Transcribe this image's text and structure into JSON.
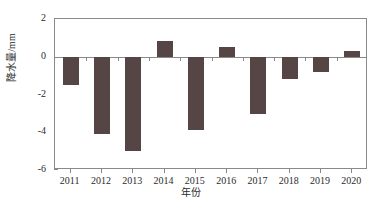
{
  "chart_data": {
    "type": "bar",
    "title": "",
    "xlabel": "年份",
    "ylabel": "降水量/mm",
    "categories": [
      "2011",
      "2012",
      "2013",
      "2014",
      "2015",
      "2016",
      "2017",
      "2018",
      "2019",
      "2020"
    ],
    "values": [
      -1.5,
      -4.1,
      -5.0,
      0.85,
      -3.9,
      0.5,
      -3.05,
      -1.2,
      -0.8,
      0.3
    ],
    "series": [
      {
        "name": "降水量距平",
        "values": [
          -1.5,
          -4.1,
          -5.0,
          0.85,
          -3.9,
          0.5,
          -3.05,
          -1.2,
          -0.8,
          0.3
        ]
      }
    ],
    "ylim": [
      -6,
      2
    ],
    "xlim": [
      2010.5,
      2020.5
    ],
    "ytick_labels": [
      "2",
      "0",
      "-2",
      "-4",
      "-6"
    ],
    "ytick_values": [
      2,
      0,
      -2,
      -4,
      -6
    ],
    "grid": false,
    "legend": "none",
    "bar_color": "#554545",
    "axis_color": "#8a8a8a",
    "background": "#ffffff"
  }
}
